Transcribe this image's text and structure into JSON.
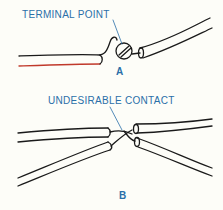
{
  "diagram": {
    "panel_a": {
      "label": "A",
      "callout": "TERMINAL POINT"
    },
    "panel_b": {
      "label": "B",
      "callout": "UNDESIRABLE CONTACT"
    },
    "colors": {
      "text": "#2a6fa8",
      "line": "#1a1a1a",
      "background": "#fdfdf8",
      "accent_wire": "#c0392b"
    }
  }
}
